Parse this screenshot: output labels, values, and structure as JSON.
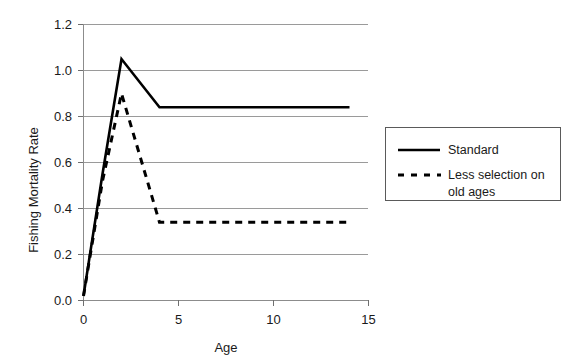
{
  "chart_data": {
    "type": "line",
    "title": "",
    "xlabel": "Age",
    "ylabel": "Fishing Mortality Rate",
    "xlim": [
      0,
      15
    ],
    "ylim": [
      0.0,
      1.2
    ],
    "xticks": [
      "0",
      "5",
      "10",
      "15"
    ],
    "xtick_values": [
      0,
      5,
      10,
      15
    ],
    "yticks": [
      "0.0",
      "0.2",
      "0.4",
      "0.6",
      "0.8",
      "1.0",
      "1.2"
    ],
    "ytick_values": [
      0.0,
      0.2,
      0.4,
      0.6,
      0.8,
      1.0,
      1.2
    ],
    "grid": "horizontal",
    "legend_position": "right-outside",
    "series": [
      {
        "name": "Standard",
        "style": "solid",
        "color": "#000000",
        "x": [
          0,
          1,
          2,
          4,
          14
        ],
        "values": [
          0.02,
          0.55,
          1.05,
          0.84,
          0.84
        ]
      },
      {
        "name": "Less selection on old ages",
        "style": "dashed",
        "color": "#000000",
        "x": [
          0,
          1,
          2,
          3,
          4,
          14
        ],
        "values": [
          0.02,
          0.52,
          0.9,
          0.62,
          0.34,
          0.34
        ]
      }
    ]
  },
  "legend": {
    "entries": [
      {
        "label": "Standard"
      },
      {
        "label": "Less selection on",
        "label2": "old ages"
      }
    ]
  },
  "axes": {
    "y_title": "Fishing Mortality Rate",
    "x_title": "Age",
    "y_labels": [
      "1.2",
      "1.0",
      "0.8",
      "0.6",
      "0.4",
      "0.2",
      "0.0"
    ],
    "x_labels": [
      "0",
      "5",
      "10",
      "15"
    ]
  }
}
